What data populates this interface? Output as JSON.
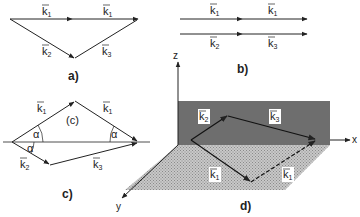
{
  "panels": {
    "a": {
      "label": "a)",
      "vectors": [
        "k1",
        "k1",
        "k2",
        "k3"
      ]
    },
    "b": {
      "label": "b)",
      "vectors": [
        "k1",
        "k1",
        "k2",
        "k3"
      ]
    },
    "c": {
      "label": "c)",
      "region_label": "(c)",
      "angle_symbol": "α",
      "vectors": [
        "k1",
        "k1",
        "k2",
        "k3"
      ]
    },
    "d": {
      "label": "d)",
      "axes": {
        "x": "x",
        "y": "y",
        "z": "z"
      },
      "vectors": [
        "k2",
        "k3",
        "k1",
        "k1"
      ]
    }
  },
  "symbols": {
    "k": "k",
    "arrow": "→",
    "sub1": "1",
    "sub2": "2",
    "sub3": "3"
  },
  "colors": {
    "line": "#222222",
    "vertical_plane": "#6e6e6e",
    "floor_plane": "#bdbdbd",
    "label_bg": "#ffffff"
  }
}
